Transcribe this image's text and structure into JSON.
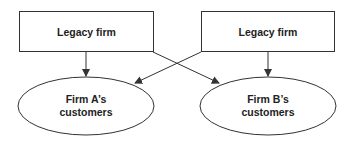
{
  "diagram": {
    "colors": {
      "stroke": "#333333",
      "text": "#222222",
      "background": "#ffffff"
    },
    "nodes": [
      {
        "id": "legacy-left",
        "shape": "rectangle",
        "label": "Legacy firm"
      },
      {
        "id": "legacy-right",
        "shape": "rectangle",
        "label": "Legacy firm"
      },
      {
        "id": "firm-a",
        "shape": "ellipse",
        "label_line1": "Firm A’s",
        "label_line2": "customers"
      },
      {
        "id": "firm-b",
        "shape": "ellipse",
        "label_line1": "Firm B’s",
        "label_line2": "customers"
      }
    ],
    "edges": [
      {
        "from": "legacy-left",
        "to": "firm-a"
      },
      {
        "from": "legacy-left",
        "to": "firm-b"
      },
      {
        "from": "legacy-right",
        "to": "firm-a"
      },
      {
        "from": "legacy-right",
        "to": "firm-b"
      }
    ]
  }
}
